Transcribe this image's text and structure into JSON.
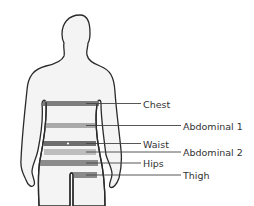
{
  "diagram": {
    "type": "body-measurement-sites",
    "colors": {
      "outline": "#2a2a2a",
      "body_fill": "#f4f4f4",
      "leader_line": "#444444",
      "text": "#333333"
    },
    "sites": [
      {
        "label": "Chest",
        "bar": {
          "x": 43,
          "y": 101,
          "w": 56,
          "h": 5
        },
        "color": "#7e7e7e",
        "line_end_x": 141,
        "label_x": 143,
        "label_y": 108
      },
      {
        "label": "Abdominal 1",
        "bar": {
          "x": 45,
          "y": 123,
          "w": 50,
          "h": 5
        },
        "color": "#a9a9a9",
        "line_end_x": 181,
        "label_x": 183,
        "label_y": 130
      },
      {
        "label": "Waist",
        "bar": {
          "x": 44,
          "y": 141,
          "w": 52,
          "h": 5
        },
        "color": "#6e6e6e",
        "line_end_x": 141,
        "label_x": 143,
        "label_y": 148,
        "marker": {
          "x": 68,
          "y": 143.5
        }
      },
      {
        "label": "Abdominal 2",
        "bar": {
          "x": 44,
          "y": 149,
          "w": 52,
          "h": 6
        },
        "color": "#bdbdbd",
        "line_end_x": 181,
        "label_x": 183,
        "label_y": 156
      },
      {
        "label": "Hips",
        "bar": {
          "x": 40,
          "y": 160,
          "w": 58,
          "h": 6
        },
        "color": "#8c8c8c",
        "line_end_x": 141,
        "label_x": 143,
        "label_y": 167
      },
      {
        "label": "Thigh",
        "bar": {
          "x": 70,
          "y": 172,
          "w": 27,
          "h": 6
        },
        "color": "#8a8a8a",
        "line_end_x": 181,
        "label_x": 183,
        "label_y": 178
      }
    ]
  }
}
